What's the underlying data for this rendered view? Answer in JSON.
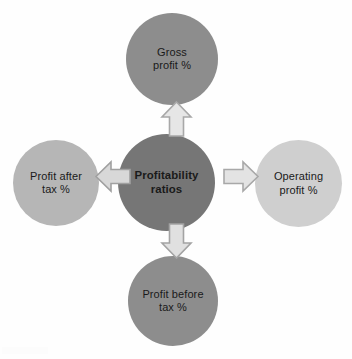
{
  "diagram": {
    "type": "hub-and-spoke",
    "center": {
      "label": "Profitability\nratios",
      "color": "#767676",
      "bold": true
    },
    "spokes": [
      {
        "id": "top",
        "label": "Gross\nprofit %",
        "color": "#8d8d8d",
        "arrow_direction": "up",
        "arrow_fill": "#e6e6e6",
        "arrow_stroke": "#a8a8a8"
      },
      {
        "id": "right",
        "label": "Operating\nprofit %",
        "color": "#cfcfcf",
        "arrow_direction": "right",
        "arrow_fill": "#e3e3e3",
        "arrow_stroke": "#a8a8a8"
      },
      {
        "id": "bottom",
        "label": "Profit before\ntax %",
        "color": "#8d8d8d",
        "arrow_direction": "down",
        "arrow_fill": "#e0e0e0",
        "arrow_stroke": "#a3a3a3"
      },
      {
        "id": "left",
        "label": "Profit after\ntax %",
        "color": "#b6b6b6",
        "arrow_direction": "left",
        "arrow_fill": "#d8d8d8",
        "arrow_stroke": "#a0a0a0"
      }
    ]
  }
}
